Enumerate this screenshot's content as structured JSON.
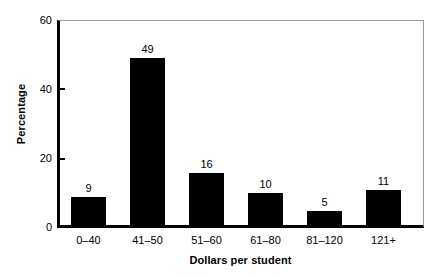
{
  "chart_data": {
    "type": "bar",
    "title": "",
    "subtitle": "",
    "xlabel": "Dollars per student",
    "ylabel": "Percentage",
    "categories": [
      "0–40",
      "41–50",
      "51–60",
      "61–80",
      "81–120",
      "121+"
    ],
    "values": [
      9,
      49,
      16,
      10,
      5,
      11
    ],
    "value_labels": [
      "9",
      "49",
      "16",
      "10",
      "5",
      "11"
    ],
    "ylim": [
      0,
      60
    ],
    "yticks": [
      0,
      20,
      40,
      60
    ],
    "ytick_labels": [
      "0",
      "20",
      "40",
      "60"
    ],
    "grid": false,
    "legend": null,
    "legend_position": "none",
    "bar_color": "#000000",
    "axis_color": "#000000",
    "frame_color": "#9a9a9a",
    "background_color": "#ffffff"
  }
}
